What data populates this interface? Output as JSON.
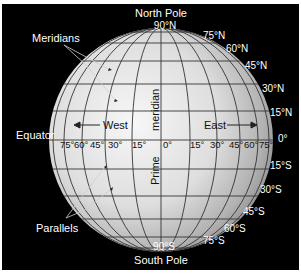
{
  "diagram": {
    "colors": {
      "background": "#000000",
      "globe_light": "#f2f2f2",
      "globe_dark": "#8c8c8c",
      "grid": "#3a3a3a",
      "label": "#ffffff"
    },
    "callouts": {
      "meridians": "Meridians",
      "parallels": "Parallels",
      "equator": "Equator",
      "north_pole": "North Pole",
      "south_pole": "South Pole",
      "prime_meridian_top": "meridian",
      "prime_meridian_bottom": "Prime",
      "west": "West",
      "east": "East"
    },
    "north_latitudes": [
      "90°N",
      "75°N",
      "60°N",
      "45°N",
      "30°N",
      "15°N"
    ],
    "equator_label": "0°",
    "south_latitudes": [
      "15°S",
      "30°S",
      "45°S",
      "60°S",
      "75°S",
      "90°S"
    ],
    "west_longitudes": [
      "75°",
      "60°",
      "45°",
      "30°",
      "15°"
    ],
    "prime_longitude": "0°",
    "east_longitudes": [
      "15°",
      "30°",
      "45°",
      "60°",
      "75°"
    ]
  }
}
